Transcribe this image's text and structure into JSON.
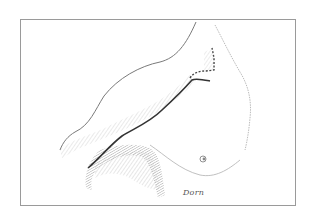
{
  "figure": {
    "signature": "Dorn",
    "colors": {
      "frame": "#9a9a9a",
      "outline": "#7a7a7a",
      "shading": "#b5b5b5",
      "incision": "#333333",
      "dashed_incision": "#444444"
    }
  }
}
